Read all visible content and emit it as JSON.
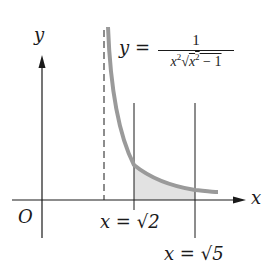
{
  "figure": {
    "axes": {
      "x_label": "x",
      "y_label": "y",
      "origin_label": "O"
    },
    "equation": {
      "lhs": "y =",
      "numerator": "1",
      "denominator_prefix": "x",
      "denominator_exp": "2",
      "denominator_radical": "√",
      "denominator_radicand": "x",
      "denominator_radicand_exp": "2",
      "denominator_radicand_tail": " − 1"
    },
    "bounds": {
      "lower_label": "x = √2",
      "upper_label": "x = √5"
    },
    "asymptote": {
      "style": "dashed",
      "at": "x = 1"
    },
    "shaded_region": {
      "description": "area under curve between x = √2 and x = √5",
      "color": "#e2e2e2"
    },
    "colors": {
      "curve": "#9a9a9a",
      "axes": "#1a1a1a",
      "shade": "#e2e2e2"
    }
  }
}
